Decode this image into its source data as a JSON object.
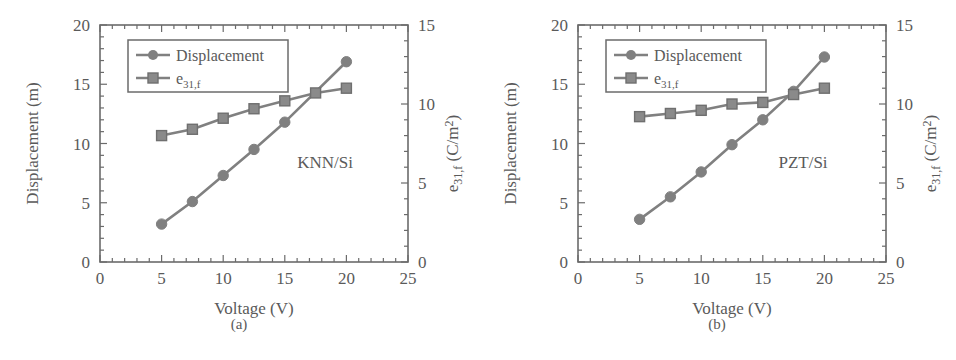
{
  "figure": {
    "width": 956,
    "height": 360,
    "background": "#ffffff",
    "ink_color": "#6b6b6b",
    "text_color": "#5a5a5a",
    "series_color": "#808080"
  },
  "panels": [
    {
      "id": "a",
      "caption": "(a)",
      "annotation": "KNN/Si",
      "legend": {
        "displacement_label": "Displacement",
        "e31f_label_base": "e",
        "e31f_label_sub": "31,f"
      },
      "axes": {
        "xlabel": "Voltage (V)",
        "ylabel_left": "Displacement (m)",
        "ylabel_right_base": "e",
        "ylabel_right_sub": "31,f",
        "ylabel_right_unit": "(C/m",
        "ylabel_right_sup": "2",
        "ylabel_right_close": ")",
        "xticks": [
          0,
          5,
          10,
          15,
          20,
          25
        ],
        "yticks_left": [
          0,
          5,
          10,
          15,
          20
        ],
        "yticks_right": [
          0,
          5,
          10,
          15
        ]
      }
    },
    {
      "id": "b",
      "caption": "(b)",
      "annotation": "PZT/Si",
      "legend": {
        "displacement_label": "Displacement",
        "e31f_label_base": "e",
        "e31f_label_sub": "31,f"
      },
      "axes": {
        "xlabel": "Voltage (V)",
        "ylabel_left": "Displacement (m)",
        "ylabel_right_base": "e",
        "ylabel_right_sub": "31,f",
        "ylabel_right_unit": "(C/m",
        "ylabel_right_sup": "2",
        "ylabel_right_close": ")",
        "xticks": [
          0,
          5,
          10,
          15,
          20,
          25
        ],
        "yticks_left": [
          0,
          5,
          10,
          15,
          20
        ],
        "yticks_right": [
          0,
          5,
          10,
          15
        ]
      }
    }
  ],
  "chart_data": [
    {
      "type": "line",
      "title": "KNN/Si",
      "panel": "(a)",
      "xlabel": "Voltage (V)",
      "ylabel": "Displacement (m)",
      "ylabel_secondary": "e31,f (C/m2)",
      "xlim": [
        0,
        25
      ],
      "ylim": [
        0,
        20
      ],
      "ylim_secondary": [
        0,
        15
      ],
      "grid": false,
      "legend_position": "upper-left",
      "series": [
        {
          "name": "Displacement",
          "axis": "left",
          "marker": "circle",
          "color": "#808080",
          "x": [
            5,
            7.5,
            10,
            12.5,
            15,
            20
          ],
          "values": [
            3.2,
            5.1,
            7.3,
            9.5,
            11.8,
            16.9
          ]
        },
        {
          "name": "e31,f",
          "axis": "right",
          "marker": "square",
          "color": "#808080",
          "x": [
            5,
            7.5,
            10,
            12.5,
            15,
            17.5,
            20
          ],
          "values": [
            8.0,
            8.4,
            9.1,
            9.7,
            10.2,
            10.7,
            11.0
          ]
        }
      ]
    },
    {
      "type": "line",
      "title": "PZT/Si",
      "panel": "(b)",
      "xlabel": "Voltage (V)",
      "ylabel": "Displacement (m)",
      "ylabel_secondary": "e31,f (C/m2)",
      "xlim": [
        0,
        25
      ],
      "ylim": [
        0,
        20
      ],
      "ylim_secondary": [
        0,
        15
      ],
      "grid": false,
      "legend_position": "upper-left",
      "series": [
        {
          "name": "Displacement",
          "axis": "left",
          "marker": "circle",
          "color": "#808080",
          "x": [
            5,
            7.5,
            10,
            12.5,
            15,
            17.5,
            20
          ],
          "values": [
            3.6,
            5.5,
            7.6,
            9.9,
            12.0,
            14.4,
            17.3
          ]
        },
        {
          "name": "e31,f",
          "axis": "right",
          "marker": "square",
          "color": "#808080",
          "x": [
            5,
            7.5,
            10,
            12.5,
            15,
            17.5,
            20
          ],
          "values": [
            9.2,
            9.4,
            9.6,
            10.0,
            10.1,
            10.6,
            11.0
          ]
        }
      ]
    }
  ]
}
